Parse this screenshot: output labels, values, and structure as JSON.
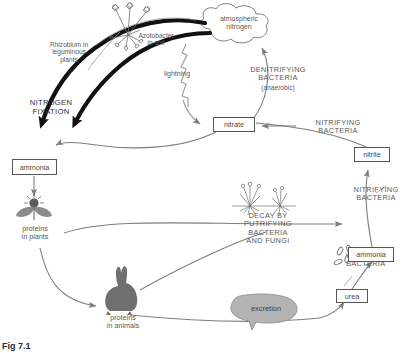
{
  "figure": {
    "caption": "Fig 7.1"
  },
  "colors": {
    "line": "#7d7d7d",
    "thick_arrow": "#111111",
    "box_border": "#555555",
    "text": "#5a5a5a",
    "caption_text": "#2b2b2b",
    "excretion_fill": "#b3b3b3",
    "animal_fill": "#707070",
    "plant_fill": "#8c8c8c",
    "background": "#ffffff"
  },
  "nodes": {
    "atmospheric_nitrogen": {
      "label": "atmospheric\nnitrogen",
      "shape": "cloud"
    },
    "nitrate": {
      "label": "nitrate",
      "shape": "box"
    },
    "nitrite": {
      "label": "nitrite",
      "shape": "box"
    },
    "ammonia_left": {
      "label": "ammonia",
      "shape": "box"
    },
    "ammonia_right": {
      "label": "ammonia",
      "shape": "box"
    },
    "urea": {
      "label": "urea",
      "shape": "box"
    },
    "excretion": {
      "label": "excretion",
      "shape": "callout"
    },
    "proteins_in_plants": {
      "label": "proteins\nin plants",
      "shape": "text"
    },
    "proteins_in_animals": {
      "label": "proteins\nin animals",
      "shape": "text"
    }
  },
  "process_labels": {
    "rhizobium": "Rhizobium in\nleguminous\nplants",
    "azotobacter": "Azotobacter\nin soil",
    "nitrogen_fixation": "NITROGEN\nFIXATION",
    "lightning": "lightning",
    "denitrifying": "DENITRIFYING\nBACTERIA",
    "denitrifying_note": "(anaerobic)",
    "nitrifying_nitrate": "NITRIFYING\nBACTERIA",
    "nitrifying_nitrite": "NITRIFYING\nBACTERIA",
    "decay": "DECAY BY\nPUTRIFYING\nBACTERIA\nAND FUNGI",
    "urea_bacteria": "UREA\nBACTERIA"
  },
  "icons": {
    "legume_plant": "legume-plant-with-root-nodules",
    "flower_plant": "flowering-plant",
    "dead_plants": "decaying-plants",
    "rabbit": "rabbit-silhouette",
    "bacteria": "rod-bacteria-cluster",
    "lightning_bolt": "lightning-zigzag-arrow"
  }
}
